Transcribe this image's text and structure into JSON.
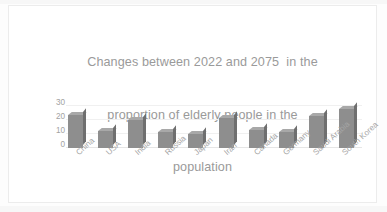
{
  "chart_data": {
    "type": "bar",
    "title": "Changes between 2022 and 2075  in the proportion of elderly people in the population",
    "title_lines": [
      "Changes between 2022 and 2075  in the",
      "proportion of elderly people in the",
      "population"
    ],
    "categories": [
      "China",
      "USA",
      "India",
      "Russia",
      "Japan",
      "Iran",
      "Canada",
      "Germany",
      "Saudi Arabia",
      "South Korea"
    ],
    "values": [
      25,
      13,
      21,
      12,
      11,
      23,
      14,
      12,
      24,
      30
    ],
    "xlabel": "",
    "ylabel": "",
    "ylim": [
      0,
      35
    ],
    "yticks": [
      30,
      20,
      10,
      0
    ],
    "ytick_labels": [
      "30",
      "20",
      "10",
      "0"
    ],
    "grid": true,
    "legend": false,
    "style": "3d-column",
    "bar_color": "#8e8e8e",
    "bar_top_color": "#a8a8a8",
    "bar_side_color": "#6f6f6f",
    "title_color": "#9a9a9a",
    "axis_text_color": "#a5a5a5",
    "gridline_color": "#f0f0f0",
    "plot_background": "#ffffff",
    "frame_border_color": "#ececec"
  }
}
